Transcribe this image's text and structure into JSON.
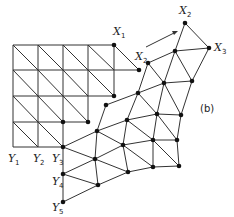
{
  "figure": {
    "panel_label": "(b)",
    "line_color": "#333333",
    "node_color": "#111111",
    "grid": {
      "xs": [
        13,
        38,
        63,
        88,
        114
      ],
      "ys": [
        45,
        70,
        96,
        122,
        147
      ],
      "description": "square mesh split into triangles by diagonals"
    },
    "labels": [
      {
        "id": "X1",
        "base": "X",
        "sub": "1",
        "x": 113,
        "y": 35
      },
      {
        "id": "X2",
        "base": "X",
        "sub": "2",
        "x": 179,
        "y": 14
      },
      {
        "id": "X3",
        "base": "X",
        "sub": "3",
        "x": 214,
        "y": 51
      },
      {
        "id": "X2p",
        "base": "X",
        "sub": "2",
        "x": 135,
        "y": 60
      },
      {
        "id": "Y1",
        "base": "Y",
        "sub": "1",
        "x": 8,
        "y": 162
      },
      {
        "id": "Y2",
        "base": "Y",
        "sub": "2",
        "x": 33,
        "y": 162
      },
      {
        "id": "Y3",
        "base": "Y",
        "sub": "3",
        "x": 52,
        "y": 162
      },
      {
        "id": "Y4",
        "base": "Y",
        "sub": "4",
        "x": 52,
        "y": 185
      },
      {
        "id": "Y5",
        "base": "Y",
        "sub": "5",
        "x": 52,
        "y": 211
      }
    ],
    "arrow": {
      "from": [
        146,
        47
      ],
      "to": [
        177,
        31
      ]
    }
  }
}
